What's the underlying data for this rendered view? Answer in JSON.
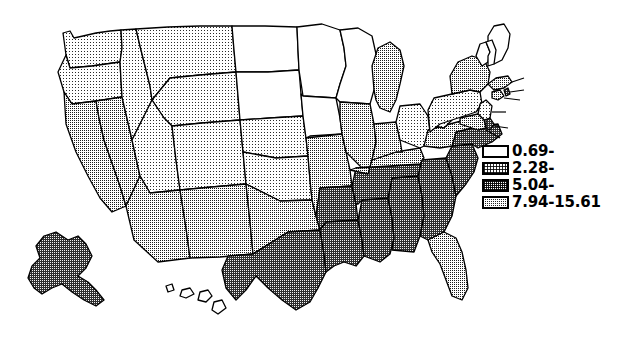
{
  "figure": {
    "type": "choropleth-map",
    "region": "United States",
    "title": ""
  },
  "legend": {
    "position": "right",
    "items": [
      {
        "label": "0.69-",
        "class_index": 0,
        "pattern": "none",
        "fill": "#ffffff",
        "lower": 0.69
      },
      {
        "label": "2.28-",
        "class_index": 1,
        "pattern": "light-stipple",
        "fill": "#d6d6d6",
        "lower": 2.28
      },
      {
        "label": "5.04-",
        "class_index": 2,
        "pattern": "medium-stipple",
        "fill": "#9a9a9a",
        "lower": 5.04
      },
      {
        "label": "7.94-15.61",
        "class_index": 3,
        "pattern": "dark-stipple",
        "fill": "#555555",
        "lower": 7.94,
        "upper": 15.61
      }
    ]
  },
  "chart_data": {
    "type": "choropleth",
    "title": "",
    "value_range": [
      0.69,
      15.61
    ],
    "class_breaks": [
      0.69,
      2.28,
      5.04,
      7.94,
      15.61
    ],
    "class_labels": [
      "0.69-",
      "2.28-",
      "5.04-",
      "7.94-15.61"
    ],
    "class_fills": [
      "#ffffff",
      "#d6d6d6",
      "#9a9a9a",
      "#555555"
    ],
    "legend_position": "right",
    "grid": false,
    "regions": [
      {
        "code": "WA",
        "name": "Washington",
        "class_index": 1
      },
      {
        "code": "OR",
        "name": "Oregon",
        "class_index": 1
      },
      {
        "code": "ID",
        "name": "Idaho",
        "class_index": 1
      },
      {
        "code": "MT",
        "name": "Montana",
        "class_index": 1
      },
      {
        "code": "WY",
        "name": "Wyoming",
        "class_index": 1
      },
      {
        "code": "ND",
        "name": "North Dakota",
        "class_index": 0
      },
      {
        "code": "SD",
        "name": "South Dakota",
        "class_index": 0
      },
      {
        "code": "MN",
        "name": "Minnesota",
        "class_index": 0
      },
      {
        "code": "WI",
        "name": "Wisconsin",
        "class_index": 0
      },
      {
        "code": "IA",
        "name": "Iowa",
        "class_index": 0
      },
      {
        "code": "NE",
        "name": "Nebraska",
        "class_index": 1
      },
      {
        "code": "CA",
        "name": "California",
        "class_index": 2
      },
      {
        "code": "NV",
        "name": "Nevada",
        "class_index": 2
      },
      {
        "code": "UT",
        "name": "Utah",
        "class_index": 1
      },
      {
        "code": "CO",
        "name": "Colorado",
        "class_index": 1
      },
      {
        "code": "AZ",
        "name": "Arizona",
        "class_index": 2
      },
      {
        "code": "NM",
        "name": "New Mexico",
        "class_index": 2
      },
      {
        "code": "KS",
        "name": "Kansas",
        "class_index": 1
      },
      {
        "code": "MO",
        "name": "Missouri",
        "class_index": 2
      },
      {
        "code": "OK",
        "name": "Oklahoma",
        "class_index": 2
      },
      {
        "code": "TX",
        "name": "Texas",
        "class_index": 3
      },
      {
        "code": "AR",
        "name": "Arkansas",
        "class_index": 3
      },
      {
        "code": "LA",
        "name": "Louisiana",
        "class_index": 3
      },
      {
        "code": "MS",
        "name": "Mississippi",
        "class_index": 3
      },
      {
        "code": "AL",
        "name": "Alabama",
        "class_index": 3
      },
      {
        "code": "GA",
        "name": "Georgia",
        "class_index": 3
      },
      {
        "code": "SC",
        "name": "South Carolina",
        "class_index": 3
      },
      {
        "code": "NC",
        "name": "North Carolina",
        "class_index": 3
      },
      {
        "code": "TN",
        "name": "Tennessee",
        "class_index": 3
      },
      {
        "code": "KY",
        "name": "Kentucky",
        "class_index": 2
      },
      {
        "code": "FL",
        "name": "Florida",
        "class_index": 2
      },
      {
        "code": "VA",
        "name": "Virginia",
        "class_index": 2
      },
      {
        "code": "WV",
        "name": "West Virginia",
        "class_index": 1
      },
      {
        "code": "OH",
        "name": "Ohio",
        "class_index": 1
      },
      {
        "code": "IN",
        "name": "Indiana",
        "class_index": 2
      },
      {
        "code": "IL",
        "name": "Illinois",
        "class_index": 2
      },
      {
        "code": "MI",
        "name": "Michigan",
        "class_index": 2
      },
      {
        "code": "PA",
        "name": "Pennsylvania",
        "class_index": 1
      },
      {
        "code": "NY",
        "name": "New York",
        "class_index": 2
      },
      {
        "code": "VT",
        "name": "Vermont",
        "class_index": 0
      },
      {
        "code": "NH",
        "name": "New Hampshire",
        "class_index": 0
      },
      {
        "code": "ME",
        "name": "Maine",
        "class_index": 0
      },
      {
        "code": "MA",
        "name": "Massachusetts",
        "class_index": 2
      },
      {
        "code": "RI",
        "name": "Rhode Island",
        "class_index": 3
      },
      {
        "code": "CT",
        "name": "Connecticut",
        "class_index": 2
      },
      {
        "code": "NJ",
        "name": "New Jersey",
        "class_index": 1
      },
      {
        "code": "DE",
        "name": "Delaware",
        "class_index": 3
      },
      {
        "code": "MD",
        "name": "Maryland",
        "class_index": 2
      },
      {
        "code": "AK",
        "name": "Alaska",
        "class_index": 3
      },
      {
        "code": "HI",
        "name": "Hawaii",
        "class_index": 0
      }
    ]
  }
}
